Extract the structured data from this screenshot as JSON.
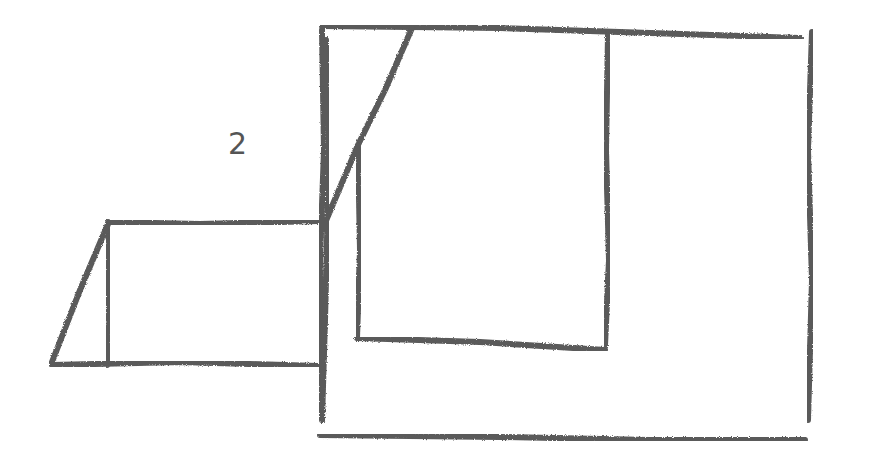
{
  "diagram": {
    "type": "hand-drawn sketch",
    "stroke_color": "#5a5a5a",
    "background": "#ffffff",
    "labels": [
      {
        "text": "2",
        "x": 228,
        "y": 128
      }
    ],
    "shapes": [
      {
        "name": "small-rectangle",
        "description": "rectangle attached to left side of large rectangle",
        "points": [
          [
            108,
            222
          ],
          [
            318,
            222
          ],
          [
            318,
            365
          ],
          [
            108,
            365
          ]
        ]
      },
      {
        "name": "small-triangle",
        "description": "triangle to the left of small rectangle",
        "points": [
          [
            108,
            222
          ],
          [
            52,
            365
          ],
          [
            108,
            365
          ]
        ]
      },
      {
        "name": "large-rectangle",
        "description": "outer large rectangle",
        "points": [
          [
            324,
            26
          ],
          [
            812,
            34
          ],
          [
            810,
            438
          ],
          [
            320,
            436
          ]
        ]
      },
      {
        "name": "diagonal-line",
        "description": "diagonal from top edge down to left edge",
        "points": [
          [
            412,
            28
          ],
          [
            320,
            232
          ]
        ]
      },
      {
        "name": "inner-rectangle",
        "description": "inner rectangle within large rectangle",
        "points": [
          [
            358,
            145
          ],
          [
            358,
            340
          ],
          [
            606,
            350
          ],
          [
            608,
            32
          ]
        ]
      }
    ]
  }
}
